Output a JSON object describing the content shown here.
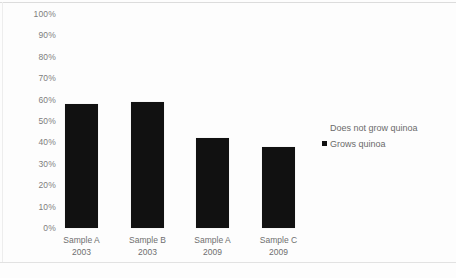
{
  "chart_data": {
    "type": "bar",
    "title": "",
    "subtitle": "",
    "xlabel": "",
    "ylabel": "",
    "grid": false,
    "legend_position": "right",
    "categories": [
      "Sample A\n2003",
      "Sample B\n2003",
      "Sample A\n2009",
      "Sample C\n2009"
    ],
    "category_lines": [
      {
        "name": "Sample A",
        "year": "2003"
      },
      {
        "name": "Sample B",
        "year": "2003"
      },
      {
        "name": "Sample A",
        "year": "2009"
      },
      {
        "name": "Sample C",
        "year": "2009"
      }
    ],
    "series": [
      {
        "name": "Grows quinoa",
        "color": "#111111",
        "values": [
          58,
          59,
          42,
          38
        ]
      },
      {
        "name": "Does not grow quinoa",
        "color": "#ffffff",
        "values": [
          42,
          41,
          58,
          62
        ]
      }
    ],
    "values": [
      58,
      59,
      42,
      38
    ],
    "ylim": [
      0,
      100
    ],
    "ytick_labels": [
      "100%",
      "90%",
      "80%",
      "70%",
      "60%",
      "50%",
      "40%",
      "30%",
      "20%",
      "10%",
      "0%"
    ],
    "ytick_values": [
      100,
      90,
      80,
      70,
      60,
      50,
      40,
      30,
      20,
      10,
      0
    ],
    "value_suffix": "%"
  },
  "legend": {
    "items": [
      {
        "label": "Does not grow quinoa",
        "swatch": "light"
      },
      {
        "label": "Grows quinoa",
        "swatch": "dark"
      }
    ]
  },
  "colors": {
    "bar": "#111111",
    "axis_text": "#7d7d7d",
    "background": "#fdfdfd"
  }
}
